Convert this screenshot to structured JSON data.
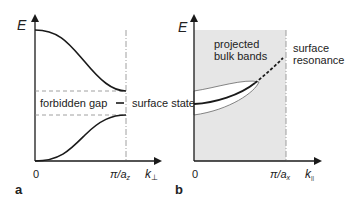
{
  "panel_a": {
    "letter": "a",
    "y_axis_label": "E",
    "x_origin": "0",
    "x_boundary_label": "π/a",
    "x_boundary_sub": "z",
    "x_axis_label": "k",
    "x_axis_sub": "⊥",
    "gap_label": "forbidden gap",
    "state_label": "surface state"
  },
  "panel_b": {
    "letter": "b",
    "y_axis_label": "E",
    "x_origin": "0",
    "x_boundary_label": "π/a",
    "x_boundary_sub": "x",
    "x_axis_label": "k",
    "x_axis_sub": "||",
    "bulk_label_line1": "projected",
    "bulk_label_line2": "bulk bands",
    "resonance_label_line1": "surface",
    "resonance_label_line2": "resonance"
  },
  "colors": {
    "curve": "#1a1a1a",
    "shade": "#e6e6e6",
    "dash": "#888888"
  }
}
